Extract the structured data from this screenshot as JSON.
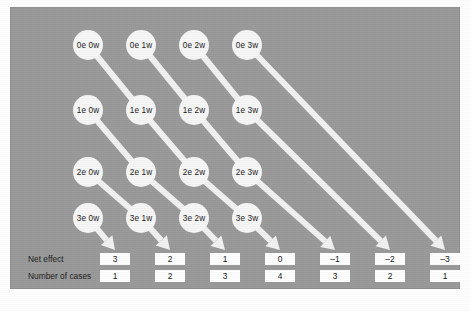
{
  "figure": {
    "background_color": "#ffffff",
    "panel_color": "#9a9a9a",
    "node_color": "#f7f7f7",
    "connector_color": "#f2f2f2",
    "box_color": "#ffffff",
    "text_color": "#1a1a1a"
  },
  "grid": {
    "rows": [
      "0e",
      "1e",
      "2e",
      "3e"
    ],
    "columns": [
      "0w",
      "1w",
      "2w",
      "3w"
    ],
    "nodes": [
      {
        "id": "n-0e-0w",
        "label": "0e 0w",
        "row": 0,
        "col": 0,
        "cx": 88,
        "cy": 45
      },
      {
        "id": "n-0e-1w",
        "label": "0e 1w",
        "row": 0,
        "col": 1,
        "cx": 141,
        "cy": 45
      },
      {
        "id": "n-0e-2w",
        "label": "0e 2w",
        "row": 0,
        "col": 2,
        "cx": 194,
        "cy": 45
      },
      {
        "id": "n-0e-3w",
        "label": "0e 3w",
        "row": 0,
        "col": 3,
        "cx": 247,
        "cy": 45
      },
      {
        "id": "n-1e-0w",
        "label": "1e 0w",
        "row": 1,
        "col": 0,
        "cx": 88,
        "cy": 110
      },
      {
        "id": "n-1e-1w",
        "label": "1e 1w",
        "row": 1,
        "col": 1,
        "cx": 141,
        "cy": 110
      },
      {
        "id": "n-1e-2w",
        "label": "1e 2w",
        "row": 1,
        "col": 2,
        "cx": 194,
        "cy": 110
      },
      {
        "id": "n-1e-3w",
        "label": "1e 3w",
        "row": 1,
        "col": 3,
        "cx": 247,
        "cy": 110
      },
      {
        "id": "n-2e-0w",
        "label": "2e 0w",
        "row": 2,
        "col": 0,
        "cx": 88,
        "cy": 172
      },
      {
        "id": "n-2e-1w",
        "label": "2e 1w",
        "row": 2,
        "col": 1,
        "cx": 141,
        "cy": 172
      },
      {
        "id": "n-2e-2w",
        "label": "2e 2w",
        "row": 2,
        "col": 2,
        "cx": 194,
        "cy": 172
      },
      {
        "id": "n-2e-3w",
        "label": "2e 3w",
        "row": 2,
        "col": 3,
        "cx": 247,
        "cy": 172
      },
      {
        "id": "n-3e-0w",
        "label": "3e 0w",
        "row": 3,
        "col": 0,
        "cx": 88,
        "cy": 218
      },
      {
        "id": "n-3e-1w",
        "label": "3e 1w",
        "row": 3,
        "col": 1,
        "cx": 141,
        "cy": 218
      },
      {
        "id": "n-3e-2w",
        "label": "3e 2w",
        "row": 3,
        "col": 2,
        "cx": 194,
        "cy": 218
      },
      {
        "id": "n-3e-3w",
        "label": "3e 3w",
        "row": 3,
        "col": 3,
        "cx": 247,
        "cy": 218
      }
    ]
  },
  "rows": {
    "net_effect_label": "Net effect",
    "number_of_cases_label": "Number of cases",
    "net_effect_y": 259,
    "number_of_cases_y": 276,
    "label_x": 28
  },
  "columns": [
    {
      "index": 0,
      "x": 115,
      "net_effect": "3",
      "cases": "1"
    },
    {
      "index": 1,
      "x": 170,
      "net_effect": "2",
      "cases": "2"
    },
    {
      "index": 2,
      "x": 225,
      "net_effect": "1",
      "cases": "3"
    },
    {
      "index": 3,
      "x": 280,
      "net_effect": "0",
      "cases": "4"
    },
    {
      "index": 4,
      "x": 335,
      "net_effect": "–1",
      "cases": "3"
    },
    {
      "index": 5,
      "x": 390,
      "net_effect": "–2",
      "cases": "2"
    },
    {
      "index": 6,
      "x": 445,
      "net_effect": "–3",
      "cases": "1"
    }
  ],
  "connectors": {
    "description": "Diagonal white ribbons running down-right from each node; terminal ribbons end in arrowheads above the Net effect boxes.",
    "node_to_node": [
      {
        "from": "n-0e-0w",
        "to": "n-1e-1w"
      },
      {
        "from": "n-0e-1w",
        "to": "n-1e-2w"
      },
      {
        "from": "n-0e-2w",
        "to": "n-1e-3w"
      },
      {
        "from": "n-1e-0w",
        "to": "n-2e-1w"
      },
      {
        "from": "n-1e-1w",
        "to": "n-2e-2w"
      },
      {
        "from": "n-1e-2w",
        "to": "n-2e-3w"
      },
      {
        "from": "n-2e-0w",
        "to": "n-3e-1w"
      },
      {
        "from": "n-2e-1w",
        "to": "n-3e-2w"
      },
      {
        "from": "n-2e-2w",
        "to": "n-3e-3w"
      }
    ],
    "node_to_box": [
      {
        "from": "n-3e-0w",
        "to_column": 0
      },
      {
        "from": "n-3e-1w",
        "to_column": 1
      },
      {
        "from": "n-3e-2w",
        "to_column": 2
      },
      {
        "from": "n-3e-3w",
        "to_column": 3
      },
      {
        "from": "n-2e-3w",
        "to_column": 4
      },
      {
        "from": "n-1e-3w",
        "to_column": 5
      },
      {
        "from": "n-0e-3w",
        "to_column": 6
      }
    ]
  }
}
